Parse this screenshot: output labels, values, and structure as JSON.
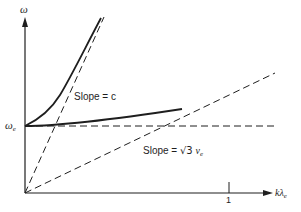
{
  "diagram": {
    "type": "dispersion-relation",
    "axes": {
      "y_label": "ω",
      "x_label_main": "kλ",
      "x_label_sub": "e",
      "x_tick_label": "1",
      "y_level_label_main": "ω",
      "y_level_label_sub": "e"
    },
    "annotations": {
      "slope_c": "Slope = c",
      "slope_sound_prefix": "Slope = ",
      "slope_sound_sqrt": "√3",
      "slope_sound_var": "v",
      "slope_sound_sub": "e"
    },
    "curves": [
      {
        "name": "electromagnetic-branch",
        "style": "solid",
        "description": "rises from ωe toward asymptote slope c"
      },
      {
        "name": "electron-plasma-branch",
        "style": "solid",
        "description": "rises slowly from ωe"
      },
      {
        "name": "light-line",
        "style": "dashed",
        "slope": "c"
      },
      {
        "name": "sound-line",
        "style": "dashed",
        "slope": "√3 ve"
      },
      {
        "name": "plasma-frequency-line",
        "style": "dashed",
        "level": "ωe"
      }
    ],
    "colors": {
      "ink": "#1e1e1e",
      "background": "#ffffff"
    }
  }
}
